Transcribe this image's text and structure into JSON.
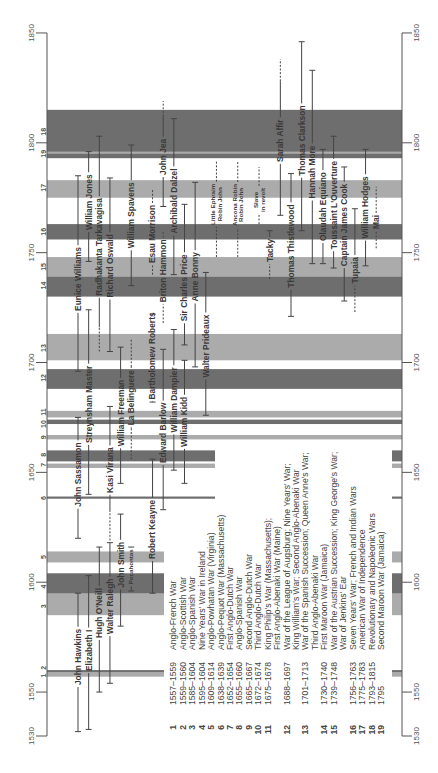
{
  "chart_data": {
    "type": "bar",
    "mark": "range",
    "title": "",
    "xlabel": "",
    "ylabel": "",
    "axis": {
      "min": 1530,
      "max": 1850,
      "ticks": [
        1530,
        1550,
        1600,
        1650,
        1700,
        1750,
        1800,
        1850
      ],
      "tick_labels": [
        "1530",
        "1550",
        "1600",
        "1650",
        "1700",
        "1750",
        "1800",
        "1850"
      ]
    },
    "grid": false,
    "legend_position": "bottom-left",
    "colors": {
      "dark": "#6e6e6e",
      "light": "#ababab",
      "line": "#444444",
      "axis": "#555555"
    },
    "wars": [
      {
        "id": 1,
        "start": 1557,
        "end": 1559,
        "tone": "light",
        "dates": "1557–1559",
        "name_lines": [
          "Anglo-French War"
        ]
      },
      {
        "id": 2,
        "start": 1559,
        "end": 1560,
        "tone": "dark",
        "dates": "1559–1560",
        "name_lines": [
          "Anglo-Scottish War"
        ]
      },
      {
        "id": 3,
        "start": 1585,
        "end": 1604,
        "tone": "light",
        "dates": "1585–1604",
        "name_lines": [
          "Anglo-Spanish War"
        ]
      },
      {
        "id": 4,
        "start": 1595,
        "end": 1604,
        "tone": "dark",
        "dates": "1595–1604",
        "name_lines": [
          "Nine Years' War in Ireland"
        ]
      },
      {
        "id": 5,
        "start": 1609,
        "end": 1614,
        "tone": "light",
        "dates": "1609–1614",
        "name_lines": [
          "Anglo-Powhatan War (Virginia)"
        ]
      },
      {
        "id": 6,
        "start": 1638,
        "end": 1639,
        "tone": "dark",
        "dates": "1638–1639",
        "name_lines": [
          "Anglo-Pequot War (Massachusetts)"
        ]
      },
      {
        "id": 7,
        "start": 1652,
        "end": 1654,
        "tone": "light",
        "dates": "1652–1654",
        "name_lines": [
          "First Anglo-Dutch War"
        ]
      },
      {
        "id": 8,
        "start": 1655,
        "end": 1660,
        "tone": "dark",
        "dates": "1655–1660",
        "name_lines": [
          "Anglo-Spanish War"
        ]
      },
      {
        "id": 9,
        "start": 1665,
        "end": 1667,
        "tone": "light",
        "dates": "1665–1667",
        "name_lines": [
          "Second Anglo-Dutch War"
        ]
      },
      {
        "id": 10,
        "start": 1672,
        "end": 1674,
        "tone": "dark",
        "dates": "1672–1674",
        "name_lines": [
          "Third Anglo-Dutch War"
        ]
      },
      {
        "id": 11,
        "start": 1675,
        "end": 1678,
        "tone": "light",
        "dates": "1675–1678",
        "name_lines": [
          "King Philip's War (Massachusetts);",
          "First Anglo-Abenaki War (Maine)"
        ]
      },
      {
        "id": 12,
        "start": 1688,
        "end": 1697,
        "tone": "dark",
        "dates": "1688–1697",
        "name_lines": [
          "War of the League of Augsburg; Nine Years' War;",
          "King William's War; Second Anglo-Abenaki War"
        ]
      },
      {
        "id": 13,
        "start": 1701,
        "end": 1713,
        "tone": "light",
        "dates": "1701–1713",
        "name_lines": [
          "War of the Spanish Succession; Queen Anne's War;",
          "Third Anglo-Abenaki War"
        ]
      },
      {
        "id": 14,
        "start": 1730,
        "end": 1740,
        "tone": "dark",
        "dates": "1730–1740",
        "name_lines": [
          "First Maroon War (Jamaica)"
        ]
      },
      {
        "id": 15,
        "start": 1739,
        "end": 1748,
        "tone": "light",
        "dates": "1739–1748",
        "name_lines": [
          "War of the Austrian Succession; King George's War;",
          "War of Jenkins' Ear"
        ]
      },
      {
        "id": 16,
        "start": 1756,
        "end": 1763,
        "tone": "dark",
        "dates": "1756–1763",
        "name_lines": [
          "Seven Years' War; French and Indian Wars"
        ]
      },
      {
        "id": 17,
        "start": 1775,
        "end": 1783,
        "tone": "light",
        "dates": "1775–1783",
        "name_lines": [
          "American War of Independence"
        ]
      },
      {
        "id": 18,
        "start": 1793,
        "end": 1815,
        "tone": "dark",
        "dates": "1793–1815",
        "name_lines": [
          "Revolutionary and Napoleonic Wars"
        ]
      },
      {
        "id": 19,
        "start": 1795,
        "end": 1795,
        "tone": "light",
        "dates": "1795",
        "name_lines": [
          "Second Maroon War (Jamaica)"
        ]
      }
    ],
    "people": [
      {
        "name_lines": [
          "John Hawkins"
        ],
        "born": 1532,
        "died": 1595,
        "uncertain": []
      },
      {
        "name_lines": [
          "Elizabeth I"
        ],
        "born": 1533,
        "died": 1603,
        "uncertain": []
      },
      {
        "name_lines": [
          "Hugh O'Neill"
        ],
        "born": 1550,
        "died": 1616,
        "uncertain": []
      },
      {
        "name_lines": [
          "Walter Ralegh"
        ],
        "born": 1554,
        "died": 1618,
        "uncertain": []
      },
      {
        "name_lines": [
          "John Smith"
        ],
        "born": 1580,
        "died": 1631,
        "uncertain": []
      },
      {
        "name_lines": [
          "Pocahontas"
        ],
        "born": 1596,
        "died": 1616,
        "uncertain": []
      },
      {
        "name_lines": [
          "Robert Keayne"
        ],
        "born": 1595,
        "died": 1656,
        "uncertain": []
      },
      {
        "name_lines": [
          "John Sassamon"
        ],
        "born": 1620,
        "died": 1675,
        "uncertain": []
      },
      {
        "name_lines": [
          "Streynsham Master"
        ],
        "born": 1640,
        "died": 1724,
        "uncertain": []
      },
      {
        "name_lines": [
          "Kasi Virana"
        ],
        "born": 1619,
        "died": 1680,
        "uncertain": [
          [
            1619,
            1632
          ]
        ]
      },
      {
        "name_lines": [
          "William Freeman"
        ],
        "born": 1645,
        "died": 1707,
        "uncertain": []
      },
      {
        "name_lines": [
          "La Belinguere"
        ],
        "born": 1656,
        "died": 1711,
        "uncertain": [
          [
            1656,
            1670
          ],
          [
            1698,
            1711
          ]
        ]
      },
      {
        "name_lines": [
          "Edward Barlow"
        ],
        "born": 1633,
        "died": 1706,
        "uncertain": []
      },
      {
        "name_lines": [
          "William Dampier"
        ],
        "born": 1651,
        "died": 1715,
        "uncertain": []
      },
      {
        "name_lines": [
          "William Kidd"
        ],
        "born": 1645,
        "died": 1701,
        "uncertain": []
      },
      {
        "name_lines": [
          "Bartholomew Roberts"
        ],
        "born": 1682,
        "died": 1722,
        "uncertain": []
      },
      {
        "name_lines": [
          "Walter Prideaux"
        ],
        "born": 1676,
        "died": 1741,
        "uncertain": []
      },
      {
        "name_lines": [
          "Eunice Williams"
        ],
        "born": 1696,
        "died": 1785,
        "uncertain": []
      },
      {
        "name_lines": [
          "William Jones"
        ],
        "born": 1746,
        "died": 1796,
        "uncertain": []
      },
      {
        "name_lines": [
          "Radhakanta Tarkavagisa"
        ],
        "born": 1705,
        "died": 1803,
        "uncertain": [
          [
            1705,
            1716
          ]
        ]
      },
      {
        "name_lines": [
          "Richard Oswald"
        ],
        "born": 1705,
        "died": 1784,
        "uncertain": []
      },
      {
        "name_lines": [
          "William Spavens"
        ],
        "born": 1735,
        "died": 1799,
        "uncertain": []
      },
      {
        "name_lines": [
          "Esau Morrison"
        ],
        "born": 1740,
        "died": 1779,
        "uncertain": [
          [
            1740,
            1779
          ]
        ]
      },
      {
        "name_lines": [
          "Briton Hammon"
        ],
        "born": 1718,
        "died": 1760,
        "uncertain": [
          [
            1718,
            1760
          ]
        ]
      },
      {
        "name_lines": [
          "Sir Charles Price"
        ],
        "born": 1708,
        "died": 1772,
        "uncertain": []
      },
      {
        "name_lines": [
          "Anne Bonny"
        ],
        "born": 1698,
        "died": 1782,
        "uncertain": []
      },
      {
        "name_lines": [
          "John Jea"
        ],
        "born": 1771,
        "died": 1819,
        "uncertain": [
          [
            1812,
            1819
          ]
        ]
      },
      {
        "name_lines": [
          "Archibald Dalzel"
        ],
        "born": 1740,
        "died": 1811,
        "uncertain": []
      },
      {
        "name_lines": [
          "Little Ephraim",
          "Robin John"
        ],
        "born": 1748,
        "died": 1792,
        "uncertain": [
          [
            1748,
            1792
          ]
        ]
      },
      {
        "name_lines": [
          "Ancona Robin",
          "Robin John"
        ],
        "born": 1748,
        "died": 1792,
        "uncertain": [
          [
            1748,
            1792
          ]
        ]
      },
      {
        "name_lines": [
          "Slave",
          "in revolt"
        ],
        "born": 1763,
        "died": 1789,
        "uncertain": [
          [
            1763,
            1789
          ]
        ]
      },
      {
        "name_lines": [
          "Tacky"
        ],
        "born": 1738,
        "died": 1760,
        "uncertain": [
          [
            1738,
            1745
          ]
        ]
      },
      {
        "name_lines": [
          "Sarah Affir"
        ],
        "born": 1767,
        "died": 1838,
        "uncertain": [
          [
            1828,
            1838
          ]
        ]
      },
      {
        "name_lines": [
          "Thomas Thistlewood"
        ],
        "born": 1721,
        "died": 1786,
        "uncertain": []
      },
      {
        "name_lines": [
          "Thomas Clarkson"
        ],
        "born": 1760,
        "died": 1846,
        "uncertain": []
      },
      {
        "name_lines": [
          "Hannah More"
        ],
        "born": 1745,
        "died": 1833,
        "uncertain": []
      },
      {
        "name_lines": [
          "Olaudah Equiano"
        ],
        "born": 1745,
        "died": 1797,
        "uncertain": []
      },
      {
        "name_lines": [
          "Toussaint L'Ouverture"
        ],
        "born": 1743,
        "died": 1803,
        "uncertain": []
      },
      {
        "name_lines": [
          "Captain James Cook"
        ],
        "born": 1728,
        "died": 1789,
        "uncertain": []
      },
      {
        "name_lines": [
          "Tupaia"
        ],
        "born": 1723,
        "died": 1770,
        "uncertain": [
          [
            1723,
            1735
          ]
        ]
      },
      {
        "name_lines": [
          "William Hodges"
        ],
        "born": 1744,
        "died": 1797,
        "uncertain": []
      },
      {
        "name_lines": [
          "Mai"
        ],
        "born": 1752,
        "died": 1780,
        "uncertain": [
          [
            1752,
            1780
          ]
        ]
      }
    ]
  }
}
